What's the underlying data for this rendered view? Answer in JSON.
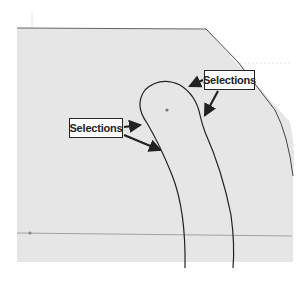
{
  "diagram": {
    "background_color": "#ffffff",
    "sketch_fill": "#e6e6e6",
    "outline_color": "#333333",
    "centerline_color": "#9a9a9a",
    "arrow_color": "#222222"
  },
  "callouts": [
    {
      "id": "selections-top",
      "label": "Selections"
    },
    {
      "id": "selections-left",
      "label": "Selections"
    }
  ]
}
